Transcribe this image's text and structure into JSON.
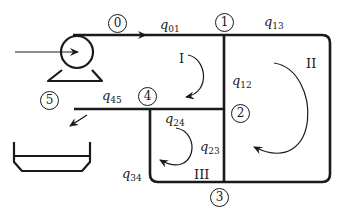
{
  "diagram": {
    "colors": {
      "line": "#1a1a1a",
      "background": "#ffffff"
    },
    "components": {
      "pump": {
        "icon": "pump-icon",
        "inlet_arrow": "arrow-right-icon"
      },
      "tank": {
        "icon": "tank-icon",
        "outlet_arrow": "arrow-down-left-icon"
      }
    },
    "nodes": [
      {
        "id": "0",
        "label": "0"
      },
      {
        "id": "1",
        "label": "1"
      },
      {
        "id": "2",
        "label": "2"
      },
      {
        "id": "3",
        "label": "3"
      },
      {
        "id": "4",
        "label": "4"
      },
      {
        "id": "5",
        "label": "5"
      }
    ],
    "flows": [
      {
        "id": "q01",
        "symbol": "q",
        "subscript": "01"
      },
      {
        "id": "q13",
        "symbol": "q",
        "subscript": "13"
      },
      {
        "id": "q12",
        "symbol": "q",
        "subscript": "12"
      },
      {
        "id": "q45",
        "symbol": "q",
        "subscript": "45"
      },
      {
        "id": "q24",
        "symbol": "q",
        "subscript": "24"
      },
      {
        "id": "q23",
        "symbol": "q",
        "subscript": "23"
      },
      {
        "id": "q34",
        "symbol": "q",
        "subscript": "34"
      }
    ],
    "loops": [
      {
        "id": "I",
        "label": "I",
        "direction": "clockwise"
      },
      {
        "id": "II",
        "label": "II",
        "direction": "clockwise"
      },
      {
        "id": "III",
        "label": "III",
        "direction": "clockwise"
      }
    ]
  }
}
